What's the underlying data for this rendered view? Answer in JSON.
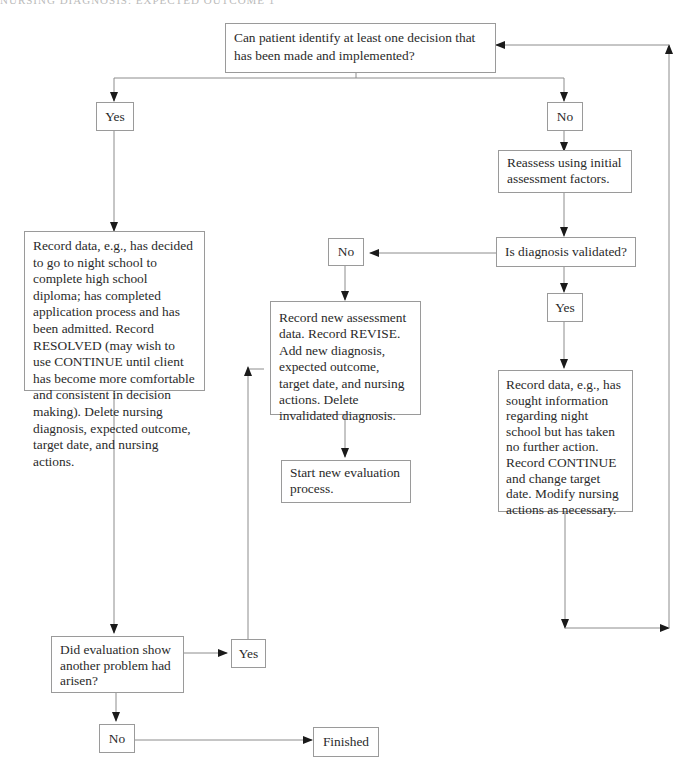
{
  "header": {
    "text": "NURSING DIAGNOSIS: EXPECTED OUTCOME 1"
  },
  "flowchart": {
    "start_question": "Can patient identify at least one decision that has been made and implemented?",
    "yes_1": "Yes",
    "no_1": "No",
    "resolved_record": "Record data, e.g., has decided to go to night school to complete high school diploma; has completed application process and has been admitted. Record RESOLVED (may wish to use CONTINUE until client has become more comfortable and consistent in decision making). Delete nursing diagnosis, expected outcome, target date, and nursing actions.",
    "reassess": "Reassess using initial assessment factors.",
    "validated_question": "Is diagnosis validated?",
    "no_2": "No",
    "yes_2": "Yes",
    "revise_record": "Record new assessment data. Record REVISE. Add new diagnosis, expected outcome, target date, and nursing actions. Delete invalidated diagnosis.",
    "start_new": "Start new evaluation process.",
    "continue_record": "Record data, e.g., has sought information regarding night school but has taken no further action. Record CONTINUE and change target date. Modify nursing actions as necessary.",
    "another_problem_question": "Did evaluation show another problem had arisen?",
    "yes_3": "Yes",
    "no_3": "No",
    "finished": "Finished"
  },
  "colors": {
    "line": "#8c8c8c",
    "arrow": "#1a1a1a",
    "border": "#9a9a9a",
    "text": "#2a2a2a"
  }
}
